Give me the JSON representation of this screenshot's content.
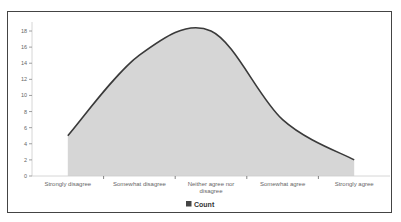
{
  "chart_data": {
    "type": "area",
    "title": "",
    "xlabel": "",
    "ylabel": "",
    "categories": [
      "Strongly disagree",
      "Somewhat disagree",
      "Neither agree nor disagree",
      "Somewhat agree",
      "Strongly agree"
    ],
    "category_lines": [
      [
        "Strongly disagree"
      ],
      [
        "Somewhat disagree"
      ],
      [
        "Neither agree nor",
        "disagree"
      ],
      [
        "Somewhat agree"
      ],
      [
        "Strongly agree"
      ]
    ],
    "series": [
      {
        "name": "Count",
        "values": [
          5,
          15,
          18,
          7,
          2
        ]
      }
    ],
    "ylim": [
      0,
      18
    ],
    "yticks": [
      0,
      2,
      4,
      6,
      8,
      10,
      12,
      14,
      16,
      18
    ],
    "grid": false,
    "smooth": true,
    "legend": {
      "position": "bottom",
      "entries": [
        "Count"
      ]
    },
    "colors": {
      "line": "#3a3a3a",
      "fill": "#d6d6d6",
      "legend_swatch": "#444444",
      "frame": "#444444"
    }
  }
}
